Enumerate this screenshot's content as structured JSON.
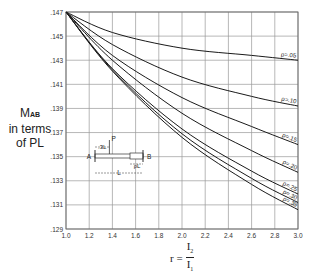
{
  "chart_data": {
    "type": "line",
    "title": "",
    "xlabel": "r = I2 / I1",
    "ylabel": "M_AB in terms of PL",
    "xlim": [
      1.0,
      3.0
    ],
    "ylim": [
      0.129,
      0.147
    ],
    "grid": true,
    "legend_position": "inline labels at right end of each curve",
    "x_ticks": [
      "1.0",
      "1.2",
      "1.4",
      "1.6",
      "1.8",
      "2.0",
      "2.2",
      "2.4",
      "2.6",
      "2.8",
      "3.0"
    ],
    "y_ticks": [
      ".147",
      ".145",
      ".143",
      ".141",
      ".139",
      ".137",
      ".135",
      ".133",
      ".131",
      ".129"
    ],
    "x": [
      1.0,
      1.4,
      2.0,
      2.6,
      3.0
    ],
    "series": [
      {
        "name": "ρ = .05",
        "label": "ρ=.05",
        "values": [
          0.147,
          0.1453,
          0.144,
          0.1434,
          0.143
        ]
      },
      {
        "name": "ρ = .10",
        "label": "ρ=.10",
        "values": [
          0.147,
          0.1443,
          0.1416,
          0.14,
          0.1392
        ]
      },
      {
        "name": "ρ = .15",
        "label": "ρ=.15",
        "values": [
          0.147,
          0.1434,
          0.1399,
          0.1375,
          0.136
        ]
      },
      {
        "name": "ρ = .20",
        "label": "ρ=.20",
        "values": [
          0.147,
          0.143,
          0.1386,
          0.1355,
          0.1337
        ]
      },
      {
        "name": "ρ = .25",
        "label": "ρ=.25",
        "values": [
          0.147,
          0.1423,
          0.1373,
          0.1338,
          0.1319
        ]
      },
      {
        "name": "ρ = .30",
        "label": "ρ=.30",
        "values": [
          0.147,
          0.1422,
          0.1369,
          0.1332,
          0.1312
        ]
      },
      {
        "name": "ρ = .35",
        "label": "ρ=.35",
        "values": [
          0.147,
          0.1421,
          0.1366,
          0.1327,
          0.1306
        ]
      }
    ],
    "annotations": {
      "beam_diagram": {
        "load_label": "P",
        "load_position_label": ".3L",
        "left_support": "A",
        "right_support": "B",
        "haunch_label": "ρL",
        "span_label": "L"
      }
    }
  },
  "axis": {
    "ylabel_main": "M",
    "ylabel_sub": "AB",
    "ylabel_line2": "in terms",
    "ylabel_line3": "of PL",
    "xlabel_prefix": "r =",
    "xlabel_num": "I",
    "xlabel_num_sub": "2",
    "xlabel_den": "I",
    "xlabel_den_sub": "1"
  }
}
